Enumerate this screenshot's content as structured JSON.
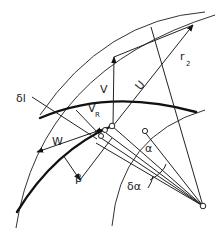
{
  "diagram": {
    "labels": {
      "absolute_velocity": "V",
      "blade_velocity": "U",
      "radius": "r",
      "radius_sub": "2",
      "relative_velocity": "W",
      "radial_velocity": "V",
      "radial_velocity_sub": "R",
      "blade_length_element": "δl",
      "blade_angle": "β",
      "angle": "α",
      "angle_increment": "δα"
    },
    "colors": {
      "line": "#222222",
      "background": "#ffffff"
    }
  }
}
